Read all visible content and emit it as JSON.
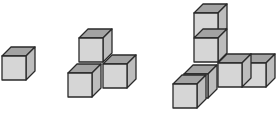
{
  "colors": {
    "background": "#ffffff",
    "top_face": "#a3a3a3",
    "front_face": "#d6d6d6",
    "side_face": "#bdbdbd",
    "edge": "#2a2a2a"
  },
  "cube": {
    "size": 24,
    "depth_dx": 9,
    "depth_dy": 9
  },
  "figures": [
    {
      "name": "figure-1",
      "cube_count": 1,
      "cubes": [
        {
          "x": 2,
          "y": 56
        }
      ]
    },
    {
      "name": "figure-2",
      "cube_count": 4,
      "cubes": [
        {
          "x": 79,
          "y": 38
        },
        {
          "x": 103,
          "y": 64
        },
        {
          "x": 68,
          "y": 73
        }
      ]
    },
    {
      "name": "figure-3",
      "cube_count": 7,
      "cubes": [
        {
          "x": 194,
          "y": 13
        },
        {
          "x": 194,
          "y": 38
        },
        {
          "x": 242,
          "y": 63
        },
        {
          "x": 218,
          "y": 63
        },
        {
          "x": 184,
          "y": 74
        },
        {
          "x": 173,
          "y": 84
        }
      ]
    }
  ]
}
